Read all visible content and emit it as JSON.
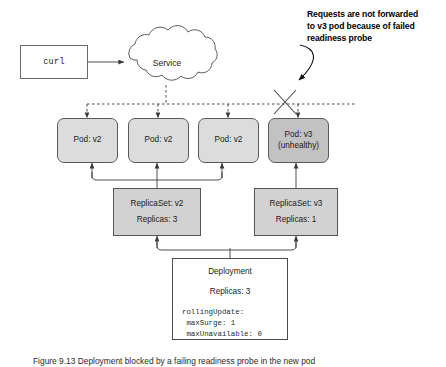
{
  "figure": {
    "client": {
      "label": "curl"
    },
    "service": {
      "label": "Service"
    },
    "annotation": {
      "lines": [
        "Requests are not forwarded",
        "to v3 pod because of failed",
        "readiness probe"
      ]
    },
    "pods": [
      {
        "name": "pod-v2-1",
        "lines": [
          "Pod: v2"
        ],
        "state": "healthy"
      },
      {
        "name": "pod-v2-2",
        "lines": [
          "Pod: v2"
        ],
        "state": "healthy"
      },
      {
        "name": "pod-v2-3",
        "lines": [
          "Pod: v2"
        ],
        "state": "healthy"
      },
      {
        "name": "pod-v3",
        "lines": [
          "Pod: v3",
          "(unhealthy)"
        ],
        "state": "unhealthy"
      }
    ],
    "replicasets": [
      {
        "name": "replicaset-v2",
        "title": "ReplicaSet: v2",
        "replicas": "Replicas: 3"
      },
      {
        "name": "replicaset-v3",
        "title": "ReplicaSet: v3",
        "replicas": "Replicas: 1"
      }
    ],
    "deployment": {
      "title": "Deployment",
      "replicas": "Replicas: 3",
      "code": [
        "rollingUpdate:",
        " maxSurge: 1",
        " maxUnavailable: 0"
      ]
    },
    "caption": "Figure 9.13  Deployment blocked by a failing readiness probe in the new pod",
    "colors": {
      "pod_healthy_fill": "#dcdcdc",
      "pod_unhealthy_fill": "#c2c2c2",
      "replicaset_fill": "#d2d2d2",
      "deployment_fill": "#ffffff",
      "stroke": "#555555"
    }
  }
}
